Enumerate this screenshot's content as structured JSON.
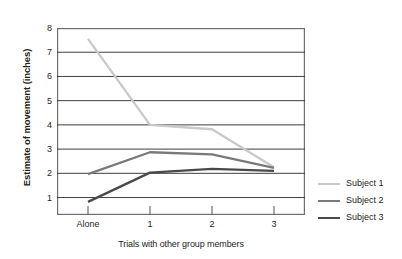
{
  "chart_data": {
    "type": "line",
    "title": "",
    "xlabel": "Trials with other group members",
    "ylabel": "Estimate of movement (inches)",
    "categories": [
      "Alone",
      "1",
      "2",
      "3"
    ],
    "x_tick_labels": [
      "Alone",
      "1",
      "2",
      "3"
    ],
    "y_tick_labels": [
      "8",
      "7",
      "6",
      "5",
      "4",
      "3",
      "2",
      "1"
    ],
    "ylim": [
      0.4,
      8
    ],
    "y_ticks": [
      1,
      2,
      3,
      4,
      5,
      6,
      7,
      8
    ],
    "grid": "horizontal",
    "legend_position": "right",
    "series": [
      {
        "name": "Subject 1",
        "color": "#c9c9c9",
        "values": [
          7.55,
          4.0,
          3.82,
          2.25
        ]
      },
      {
        "name": "Subject 2",
        "color": "#7a7a7a",
        "values": [
          1.97,
          2.87,
          2.78,
          2.22
        ]
      },
      {
        "name": "Subject 3",
        "color": "#4a4a4a",
        "values": [
          0.82,
          2.03,
          2.18,
          2.1
        ]
      }
    ]
  },
  "axes": {
    "y_title": "Estimate of movement (inches)",
    "x_title": "Trials with other group members",
    "y_tick_0": "8",
    "y_tick_1": "7",
    "y_tick_2": "6",
    "y_tick_3": "5",
    "y_tick_4": "4",
    "y_tick_5": "3",
    "y_tick_6": "2",
    "y_tick_7": "1",
    "x_tick_0": "Alone",
    "x_tick_1": "1",
    "x_tick_2": "2",
    "x_tick_3": "3"
  },
  "legend": {
    "items": [
      {
        "label": "Subject 1",
        "color": "#c9c9c9"
      },
      {
        "label": "Subject 2",
        "color": "#7a7a7a"
      },
      {
        "label": "Subject 3",
        "color": "#4a4a4a"
      }
    ]
  },
  "colors": {
    "frame": "#6f6f6f",
    "gridline": "#3f3f3f",
    "text": "#231f20",
    "background": "#ffffff"
  }
}
